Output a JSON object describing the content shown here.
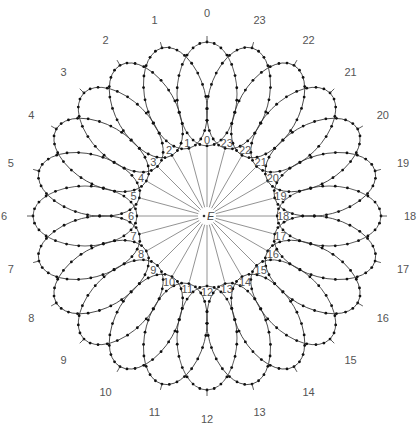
{
  "diagram": {
    "type": "rosette-of-orbits",
    "center_label": "E",
    "hours": [
      "0",
      "1",
      "2",
      "3",
      "4",
      "5",
      "6",
      "7",
      "8",
      "9",
      "10",
      "11",
      "12",
      "13",
      "14",
      "15",
      "16",
      "17",
      "18",
      "19",
      "20",
      "21",
      "22",
      "23"
    ],
    "center": {
      "x": 207,
      "y": 216
    },
    "ray_inner_radius": 9,
    "ray_outer_radius": 68,
    "inner_label_radius": 76,
    "loop_center_radius": 122,
    "loop_semi_major": 52,
    "loop_semi_minor": 30,
    "outer_label_radius": 203,
    "dots_per_loop": 26,
    "colors": {
      "line": "#333333",
      "dot": "#111111",
      "ray": "#777777",
      "label": "#555555"
    }
  }
}
